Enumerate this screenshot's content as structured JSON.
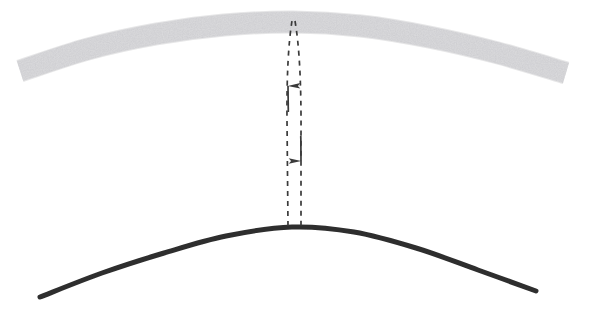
{
  "figure": {
    "title": "",
    "background_color": "#ffffff",
    "width": 609,
    "height": 313
  },
  "elements": {
    "upper_band": {
      "name": "upper-arc-band",
      "role": "thick light grey textured arc (upper surface)",
      "color": "#e2e2e4",
      "edge_color": "#d2d2d5",
      "thickness": 21,
      "start": {
        "x": 20,
        "y": 71
      },
      "apex": {
        "x": 293,
        "y": 22
      },
      "end": {
        "x": 566,
        "y": 73
      },
      "texture": "speckled-grain"
    },
    "lower_curve": {
      "name": "lower-arc-curve",
      "role": "thin dark arc (lower surface)",
      "color": "#2e2e2e",
      "thickness": 5,
      "start": {
        "x": 40,
        "y": 297
      },
      "apex": {
        "x": 292,
        "y": 227
      },
      "end": {
        "x": 536,
        "y": 291
      }
    },
    "gap_arrow_up": {
      "name": "dashed-arrow-up",
      "role": "dashed leader line with upward arrowhead",
      "color": "#3a3a3a",
      "dash_pattern": "5,5",
      "line_width": 1.7,
      "tail": {
        "x": 288,
        "y": 227
      },
      "tip": {
        "x": 292,
        "y": 21
      },
      "arrowhead": {
        "x": 288,
        "y": 84,
        "direction": "up",
        "length": 21,
        "width": 11
      }
    },
    "gap_arrow_down": {
      "name": "dashed-arrow-down",
      "role": "dashed leader line with downward arrowhead",
      "color": "#3a3a3a",
      "dash_pattern": "5,5",
      "line_width": 1.7,
      "tail": {
        "x": 296,
        "y": 21
      },
      "tip": {
        "x": 301,
        "y": 227
      },
      "arrowhead": {
        "x": 301,
        "y": 162,
        "direction": "down",
        "length": 21,
        "width": 11
      }
    }
  },
  "chart_data": {
    "type": "line",
    "title": "",
    "xlabel": "",
    "ylabel": "",
    "grid": false,
    "legend_position": "none",
    "xlim": [
      0,
      609
    ],
    "ylim": [
      313,
      0
    ],
    "annotations": [
      {
        "label": "",
        "kind": "double-headed-dashed-gap-arrow",
        "x": 294,
        "y_top": 22,
        "y_bottom": 227
      }
    ],
    "series": [
      {
        "name": "upper-arc-band",
        "kind": "thick-band",
        "color": "#e2e2e4",
        "linewidth": 21,
        "x": [
          20,
          88,
          156,
          224,
          293,
          361,
          429,
          498,
          566
        ],
        "y": [
          71,
          49,
          34,
          25,
          22,
          26,
          37,
          53,
          73
        ]
      },
      {
        "name": "lower-arc-curve",
        "kind": "thin-curve",
        "color": "#2e2e2e",
        "linewidth": 5,
        "x": [
          40,
          102,
          164,
          226,
          292,
          354,
          416,
          478,
          536
        ],
        "y": [
          297,
          273,
          253,
          236,
          227,
          232,
          248,
          270,
          291
        ]
      }
    ]
  }
}
